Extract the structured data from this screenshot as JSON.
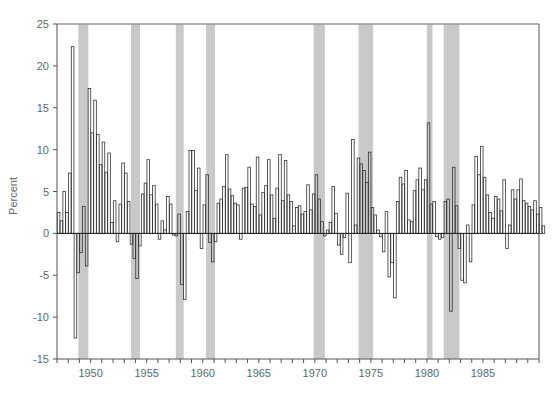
{
  "chart_data": {
    "type": "bar",
    "title": "",
    "xlabel": "",
    "ylabel": "Percent",
    "ylim": [
      -15,
      25
    ],
    "xlim": [
      1947,
      1989
    ],
    "frequency": "quarterly",
    "start_year": 1947,
    "y_ticks": [
      25,
      20,
      15,
      10,
      5,
      0,
      -5,
      -10,
      -15
    ],
    "x_ticks": [
      1950,
      1955,
      1960,
      1965,
      1970,
      1975,
      1980,
      1985
    ],
    "grid": false,
    "legend": null,
    "bar_style": "outlined",
    "shaded_regions_label": "recessions",
    "shaded_regions": [
      [
        1948.9,
        1949.8
      ],
      [
        1953.6,
        1954.4
      ],
      [
        1957.6,
        1958.3
      ],
      [
        1960.3,
        1961.1
      ],
      [
        1969.9,
        1970.9
      ],
      [
        1973.9,
        1975.2
      ],
      [
        1980.0,
        1980.5
      ],
      [
        1981.5,
        1982.9
      ]
    ],
    "series": [
      {
        "name": "Percent change",
        "values": [
          2.5,
          1.5,
          5.0,
          2.5,
          7.2,
          22.3,
          -12.5,
          -4.7,
          -2.3,
          3.2,
          -3.9,
          17.3,
          12.0,
          15.9,
          11.8,
          8.2,
          10.9,
          7.3,
          9.6,
          1.3,
          3.9,
          -1.0,
          3.5,
          8.4,
          7.2,
          3.8,
          -1.3,
          -3.0,
          -5.4,
          -1.5,
          4.7,
          6.0,
          8.8,
          4.6,
          5.7,
          3.5,
          -0.7,
          1.5,
          0.4,
          4.4,
          3.5,
          -0.2,
          -0.3,
          2.3,
          -6.1,
          -7.9,
          2.6,
          9.9,
          9.9,
          5.1,
          7.8,
          -1.8,
          3.4,
          7.0,
          -1.1,
          -3.4,
          -1.0,
          3.6,
          4.1,
          5.6,
          9.4,
          5.3,
          4.5,
          3.6,
          3.4,
          -0.7,
          5.4,
          5.5,
          7.9,
          3.5,
          3.2,
          9.1,
          2.2,
          4.9,
          5.7,
          8.8,
          4.6,
          1.8,
          5.4,
          9.4,
          3.9,
          8.7,
          4.6,
          3.8,
          0.9,
          3.1,
          3.3,
          2.3,
          2.6,
          5.8,
          2.8,
          4.7,
          7.0,
          4.1,
          1.4,
          -0.3,
          0.4,
          1.3,
          5.6,
          2.4,
          -1.4,
          -2.5,
          -0.5,
          4.8,
          -3.5,
          11.2,
          1.0,
          9.0,
          8.3,
          7.5,
          6.1,
          9.7,
          3.1,
          2.2,
          0.4,
          -0.4,
          -2.2,
          2.6,
          -5.2,
          -3.5,
          -7.7,
          3.8,
          6.7,
          5.9,
          7.5,
          1.6,
          1.4,
          5.1,
          6.4,
          7.8,
          5.2,
          6.4,
          13.2,
          3.5,
          3.8,
          -0.4,
          -0.7,
          -0.5,
          3.8,
          4.1,
          -9.3,
          7.9,
          3.3,
          -1.8,
          -5.6,
          -5.9,
          1.0,
          -3.4,
          3.4,
          9.2,
          7.0,
          10.4,
          6.7,
          4.6,
          2.5,
          1.8,
          4.4,
          4.1,
          2.7,
          6.4,
          -1.8,
          1.0,
          5.2,
          4.1,
          5.2,
          6.5,
          3.9,
          3.6,
          3.2,
          2.8,
          3.9,
          2.3,
          3.1,
          0.9
        ]
      }
    ]
  },
  "plot": {
    "left": 57,
    "right": 539,
    "top": 24,
    "bottom": 359,
    "bar_stroke": "#333333",
    "bar_fill": "#ffffff",
    "band_fill": "#c9c9c9",
    "frame_color": "#999999",
    "axis_color": "#555555",
    "zero_line_color": "#222222"
  }
}
